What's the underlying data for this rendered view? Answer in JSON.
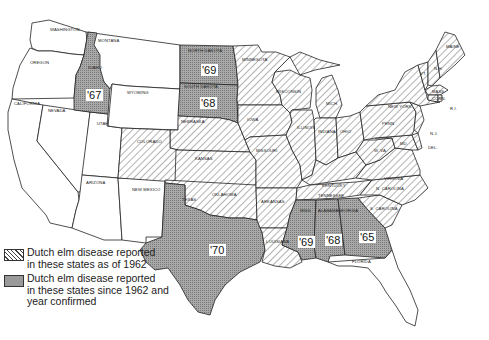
{
  "map": {
    "title": "Spread of Dutch elm disease in the United States",
    "states_hatched_as_of_1962": [
      "Colorado",
      "Nebraska",
      "Kansas",
      "Oklahoma",
      "Minnesota",
      "Iowa",
      "Missouri",
      "Arkansas",
      "Louisiana",
      "Wisconsin",
      "Illinois",
      "Michigan",
      "Indiana",
      "Ohio",
      "Kentucky",
      "Tennessee",
      "W. Virginia",
      "Virginia",
      "N. Carolina",
      "S. Carolina",
      "Penn.",
      "New York",
      "N.J.",
      "Del.",
      "Md.",
      "Conn.",
      "R.I.",
      "Mass.",
      "Vt.",
      "N.H.",
      "Maine"
    ],
    "states_since_1962": [
      {
        "state": "Idaho",
        "year": "'67"
      },
      {
        "state": "North Dakota",
        "year": "'69"
      },
      {
        "state": "South Dakota",
        "year": "'68"
      },
      {
        "state": "Texas",
        "year": "'70"
      },
      {
        "state": "Miss.",
        "year": "'69"
      },
      {
        "state": "Alabama",
        "year": "'68"
      },
      {
        "state": "Georgia",
        "year": "'65"
      }
    ],
    "states_unaffected": [
      "Washington",
      "Oregon",
      "California",
      "Nevada",
      "Utah",
      "Arizona",
      "Montana",
      "Wyoming",
      "New Mexico",
      "Florida"
    ],
    "labels": {
      "washington": "WASHINGTON",
      "oregon": "OREGON",
      "california": "CALIFORNIA",
      "nevada": "NEVADA",
      "idaho": "IDAHO",
      "montana": "MONTANA",
      "wyoming": "WYOMING",
      "utah": "UTAH",
      "arizona": "ARIZONA",
      "colorado": "COLORADO",
      "new_mexico": "NEW MEXICO",
      "north_dakota": "NORTH DAKOTA",
      "south_dakota": "SOUTH DAKOTA",
      "nebraska": "NEBRASKA",
      "kansas": "KANSAS",
      "oklahoma": "OKLAHOMA",
      "texas": "TEXAS",
      "minnesota": "MINNESOTA",
      "iowa": "IOWA",
      "missouri": "MISSOURI",
      "arkansas": "ARKANSAS",
      "louisiana": "LOUISIANA",
      "wisconsin": "WISCONSIN",
      "illinois": "ILLINOIS",
      "michigan": "MICH.",
      "indiana": "INDIANA",
      "ohio": "OHIO",
      "kentucky": "KENTUCKY",
      "tennessee": "TENNESSEE",
      "miss": "MISS.",
      "alabama": "ALABAMA",
      "georgia": "GEORGIA",
      "florida": "FLORIDA",
      "s_carolina": "S. CAROLINA",
      "n_carolina": "N. CAROLINA",
      "virginia": "VIRGINIA",
      "w_virginia": "W. VA.",
      "penn": "PENN.",
      "new_york": "NEW YORK",
      "nj": "N.J.",
      "del": "DEL.",
      "md": "MD.",
      "conn": "CONN.",
      "ri": "R.I.",
      "mass": "MASS.",
      "vt": "VT.",
      "nh": "N.H.",
      "maine": "MAINE"
    },
    "years": {
      "idaho": "'67",
      "north_dakota": "'69",
      "south_dakota": "'68",
      "texas": "'70",
      "miss": "'69",
      "alabama": "'68",
      "georgia": "'65"
    }
  },
  "legend": {
    "items": [
      {
        "pattern": "hatched",
        "text_line1": "Dutch elm disease reported",
        "text_line2": "in these states as of 1962",
        "text_line3": ""
      },
      {
        "pattern": "stippled",
        "text_line1": "Dutch elm disease reported",
        "text_line2": "in these states since 1962 and",
        "text_line3": "year confirmed"
      }
    ]
  },
  "colors": {
    "outline": "#222222",
    "hatch_line": "#444444",
    "stipple_fill": "#9a9a9a",
    "background": "#ffffff"
  }
}
